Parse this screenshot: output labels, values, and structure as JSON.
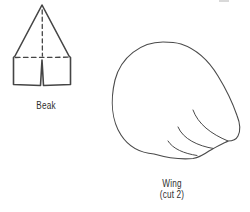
{
  "canvas": {
    "background": "#ffffff",
    "ink_color": "#454545",
    "label_color": "#2e2e2e"
  },
  "pieces": {
    "beak": {
      "label": "Beak"
    },
    "wing": {
      "label": "Wing",
      "note": "(cut 2)"
    }
  }
}
